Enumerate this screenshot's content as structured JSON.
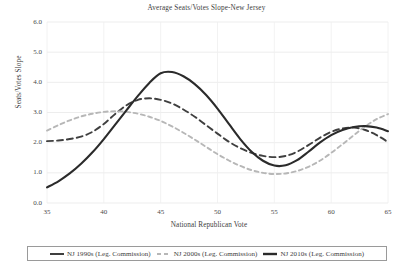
{
  "chart_data": {
    "type": "line",
    "title": "Average Seats/Votes Slope-New Jersey",
    "xlabel": "National Republican Vote",
    "ylabel": "Seats/Votes Slope",
    "xlim": [
      35,
      65
    ],
    "ylim": [
      0.0,
      6.0
    ],
    "xticks": [
      "35",
      "40",
      "45",
      "50",
      "55",
      "60",
      "65"
    ],
    "yticks": [
      "0.0",
      "1.0",
      "2.0",
      "3.0",
      "4.0",
      "5.0",
      "6.0"
    ],
    "grid": true,
    "legend_position": "below-center",
    "x": [
      35,
      36,
      37,
      38,
      39,
      40,
      41,
      42,
      43,
      44,
      45,
      46,
      47,
      48,
      49,
      50,
      51,
      52,
      53,
      54,
      55,
      56,
      57,
      58,
      59,
      60,
      61,
      62,
      63,
      64,
      65
    ],
    "series": [
      {
        "name": "NJ 1990s (Leg. Commission)",
        "style": "dashed",
        "color": "#3f3f3f",
        "width": 1.9,
        "values": [
          2.05,
          2.07,
          2.12,
          2.2,
          2.36,
          2.62,
          2.95,
          3.24,
          3.42,
          3.47,
          3.42,
          3.3,
          3.1,
          2.86,
          2.58,
          2.3,
          2.03,
          1.82,
          1.66,
          1.56,
          1.52,
          1.56,
          1.7,
          1.92,
          2.16,
          2.36,
          2.47,
          2.5,
          2.42,
          2.25,
          2.02
        ]
      },
      {
        "name": "NJ 2000s (Leg. Commission)",
        "style": "dashed",
        "color": "#b7b7b7",
        "width": 1.9,
        "values": [
          2.4,
          2.58,
          2.74,
          2.87,
          2.96,
          3.02,
          3.04,
          3.02,
          2.96,
          2.86,
          2.72,
          2.54,
          2.33,
          2.1,
          1.86,
          1.62,
          1.41,
          1.23,
          1.09,
          1.0,
          0.96,
          0.98,
          1.06,
          1.2,
          1.4,
          1.66,
          1.95,
          2.25,
          2.54,
          2.78,
          2.95
        ]
      },
      {
        "name": "NJ 2010s (Leg. Commission)",
        "style": "solid",
        "color": "#2b2b2b",
        "width": 2.1,
        "values": [
          0.52,
          0.72,
          0.98,
          1.3,
          1.68,
          2.12,
          2.6,
          3.08,
          3.55,
          3.98,
          4.3,
          4.34,
          4.2,
          3.94,
          3.58,
          3.13,
          2.62,
          2.12,
          1.7,
          1.4,
          1.24,
          1.25,
          1.42,
          1.7,
          2.0,
          2.25,
          2.42,
          2.52,
          2.55,
          2.5,
          2.38
        ]
      }
    ]
  },
  "legend": {
    "items": [
      {
        "label": "NJ 1990s (Leg. Commission)"
      },
      {
        "label": "NJ 2000s (Leg. Commission)"
      },
      {
        "label": "NJ 2010s (Leg. Commission)"
      }
    ]
  }
}
